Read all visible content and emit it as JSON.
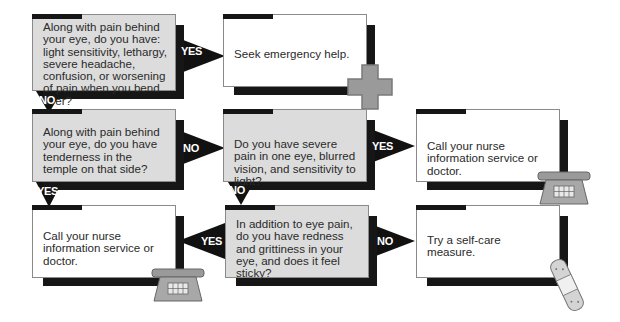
{
  "questions": {
    "q1": "Along with pain behind your eye, do you have: light sensitivity, lethargy, severe headache, confusion, or worsening of pain when you bend over?",
    "q2": "Along with pain behind your eye, do you have tenderness in the temple on that side?",
    "q3": "Do you have severe pain in one eye, blurred vision, and sensitivity to light?",
    "q4": "In addition to eye pain, do you have redness and grittiness in your eye, and does it feel sticky?"
  },
  "answers": {
    "a1": "Seek emergency help.",
    "a2": "Call your nurse information service or doctor.",
    "a3": "Call your nurse information service or doctor.",
    "a4": "Try a self-care measure."
  },
  "arrows": {
    "q1_yes": "YES",
    "q1_no": "NO",
    "q2_no": "NO",
    "q2_yes": "YES",
    "q3_yes": "YES",
    "q3_no": "NO",
    "q4_yes": "YES",
    "q4_no": "NO"
  },
  "icons": {
    "a1": "red-cross-icon",
    "a2": "telephone-icon",
    "a3": "telephone-icon",
    "a4": "bandage-icon"
  },
  "colors": {
    "question_fill": "#dcdcdc",
    "answer_fill": "#ffffff",
    "shadow": "#161616",
    "icon_gray": "#9a9a9a"
  }
}
